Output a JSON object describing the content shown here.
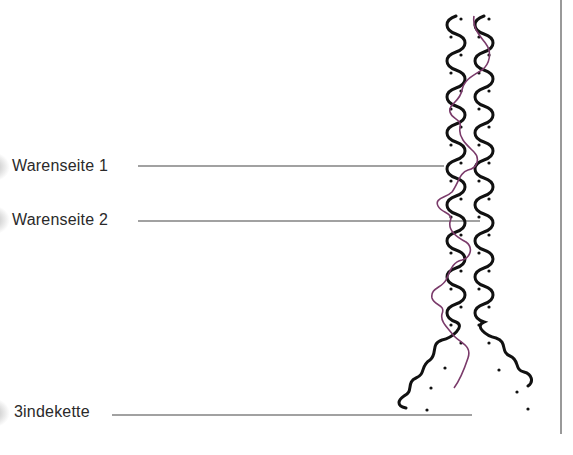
{
  "labels": [
    {
      "id": "warenseite-1",
      "text": "Warenseite 1"
    },
    {
      "id": "warenseite-2",
      "text": "Warenseite 2"
    },
    {
      "id": "bindekette",
      "text": "3indekette"
    }
  ],
  "colors": {
    "yarn": "#111111",
    "binding_thread": "#7a3a6a",
    "leader_line": "#444444",
    "frame_rule": "#777777"
  }
}
